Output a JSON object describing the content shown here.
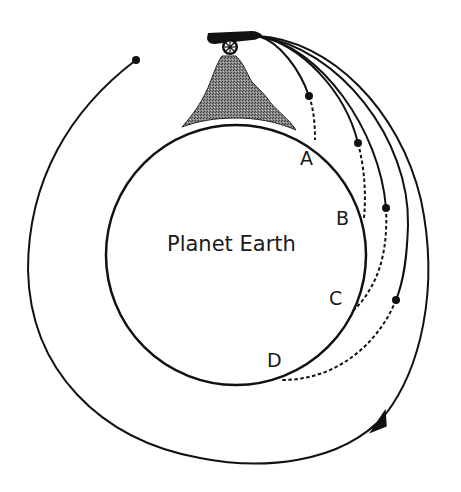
{
  "diagram": {
    "planet_label": "Planet Earth",
    "points": [
      {
        "id": "A",
        "label": "A"
      },
      {
        "id": "B",
        "label": "B"
      },
      {
        "id": "C",
        "label": "C"
      },
      {
        "id": "D",
        "label": "D"
      }
    ],
    "elements": {
      "cannon": "cannon-on-mountain",
      "mountain": "mountain",
      "planet": "planet-circle",
      "trajectories": [
        "trajectory-to-A",
        "trajectory-to-B",
        "trajectory-to-C",
        "trajectory-to-D",
        "orbit-trajectory"
      ]
    },
    "colors": {
      "line": "#111111",
      "mountain_fill": "#7a7a7a",
      "background": "#ffffff"
    }
  }
}
